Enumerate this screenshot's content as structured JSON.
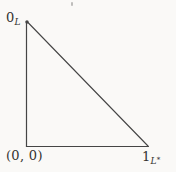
{
  "figure": {
    "type": "geometric-diagram",
    "labels": {
      "apex": {
        "main": "0",
        "sub": "L"
      },
      "origin": {
        "text": "(0, 0)"
      },
      "right": {
        "main": "1",
        "sub": "L",
        "sub_sup": "*"
      }
    },
    "colors": {
      "background": "#faf9f7",
      "line": "#454545",
      "text": "#333230"
    }
  }
}
